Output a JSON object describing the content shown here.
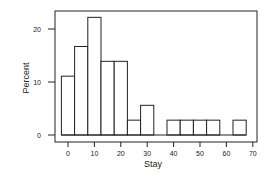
{
  "chart_data": {
    "type": "bar",
    "subtype": "histogram",
    "title": "",
    "xlabel": "Stay",
    "ylabel": "Percent",
    "bin_width": 5,
    "bin_centers": [
      0,
      5,
      10,
      15,
      20,
      25,
      30,
      35,
      40,
      45,
      50,
      55,
      60,
      65
    ],
    "values": [
      11.1,
      16.7,
      22.2,
      13.9,
      13.9,
      2.8,
      5.6,
      0,
      2.8,
      2.8,
      2.8,
      2.8,
      0,
      2.8
    ],
    "xticks": [
      0,
      10,
      20,
      30,
      40,
      50,
      60,
      70
    ],
    "yticks": [
      0,
      10,
      20
    ],
    "xlim": [
      -5,
      70
    ],
    "ylim": [
      0,
      24
    ],
    "grid": false,
    "legend": null,
    "colors": {
      "bar_fill": "#ffffff",
      "bar_edge": "#222222",
      "axis": "#222222"
    }
  }
}
